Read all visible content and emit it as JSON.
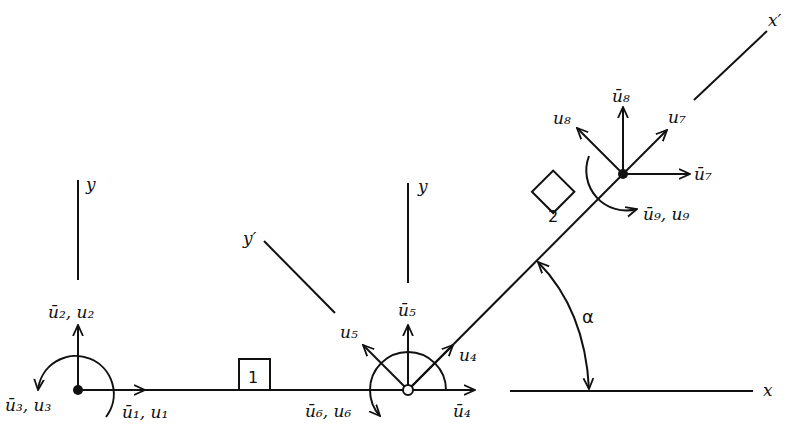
{
  "diagram": {
    "colors": {
      "ink": "#111111",
      "background": "#ffffff"
    },
    "axes": {
      "node1_y": "y",
      "node2_y": "y",
      "local_y": "y′",
      "local_x": "x′",
      "global_x": "x"
    },
    "elements": [
      {
        "id": "1",
        "label": "1",
        "shape": "square"
      },
      {
        "id": "2",
        "label": "2",
        "shape": "diamond"
      }
    ],
    "nodes": [
      {
        "id": "node-1",
        "dofs": {
          "u1": "ū₁, u₁",
          "u2": "ū₂, u₂",
          "u3": "ū₃, u₃"
        }
      },
      {
        "id": "node-2",
        "dofs": {
          "u4_local": "u₄",
          "u4_global": "ū₄",
          "u5_local": "u₅",
          "u5_global": "ū₅",
          "u6": "ū₆, u₆"
        }
      },
      {
        "id": "node-3",
        "dofs": {
          "u7_local": "u₇",
          "u7_global": "ū₇",
          "u8_local": "u₈",
          "u8_global": "ū₈",
          "u9": "ū₉, u₉"
        }
      }
    ],
    "angle": {
      "symbol": "α"
    }
  }
}
